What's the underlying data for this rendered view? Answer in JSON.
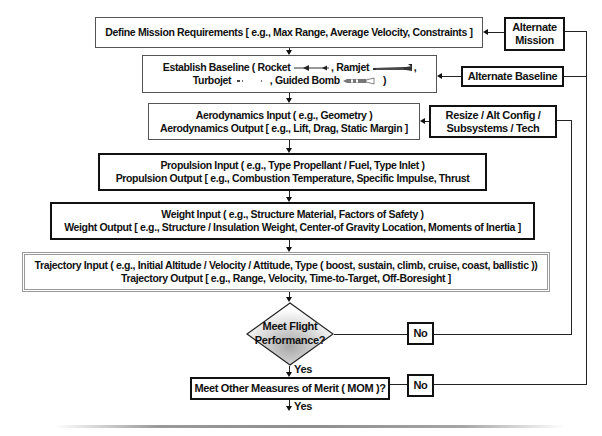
{
  "diagram": {
    "main_flow": [
      {
        "id": "define_mission",
        "lines": [
          "Define Mission Requirements [ e.g., Max Range, Average Velocity, Constraints ]"
        ]
      },
      {
        "id": "establish_baseline",
        "line1_prefix": "Establish Baseline ( Rocket",
        "line1_mid": ", Ramjet",
        "line1_suffix": ",",
        "line2_prefix": "Turbojet",
        "line2_mid": ", Guided Bomb",
        "line2_suffix": ")"
      },
      {
        "id": "aerodynamics",
        "lines": [
          "Aerodynamics Input ( e.g., Geometry )",
          "Aerodynamics Output [ e.g., Lift, Drag, Static Margin ]"
        ]
      },
      {
        "id": "propulsion",
        "lines": [
          "Propulsion Input ( e.g., Type Propellant / Fuel, Type Inlet )",
          "Propulsion Output [ e.g., Combustion Temperature, Specific Impulse, Thrust"
        ]
      },
      {
        "id": "weight",
        "lines": [
          "Weight Input ( e.g., Structure Material, Factors of Safety )",
          "Weight Output [ e.g., Structure / Insulation Weight, Center-of Gravity Location, Moments of Inertia ]"
        ]
      },
      {
        "id": "trajectory",
        "lines": [
          "Trajectory Input ( e.g., Initial Altitude / Velocity / Attitude, Type ( boost, sustain, climb, cruise, coast, ballistic ))",
          "Trajectory Output  [ e.g., Range, Velocity, Time-to-Target, Off-Boresight ]"
        ]
      }
    ],
    "decisions": {
      "flight_performance": {
        "lines": [
          "Meet Flight",
          "Performance?"
        ],
        "yes_label": "Yes",
        "no_label": "No"
      },
      "mom": {
        "text": "Meet Other Measures of Merit ( MOM )?",
        "yes_label": "Yes",
        "no_label": "No"
      }
    },
    "feedback_boxes": {
      "alternate_mission": {
        "lines": [
          "Alternate",
          "Mission"
        ]
      },
      "alternate_baseline": {
        "lines": [
          "Alternate Baseline"
        ]
      },
      "resize": {
        "lines": [
          "Resize / Alt Config /",
          "Subsystems / Tech"
        ]
      }
    },
    "icons": [
      "rocket-icon",
      "ramjet-icon",
      "turbojet-icon",
      "guided-bomb-icon"
    ],
    "colors": {
      "line": "#222222",
      "trajectory_border": "#9a9a9a",
      "diamond_fill_center": "#a8a8a8",
      "diamond_fill_edge": "#ffffff"
    }
  }
}
